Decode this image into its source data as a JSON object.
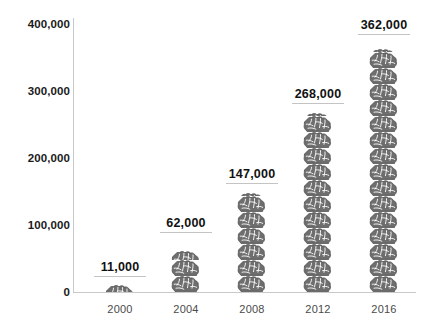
{
  "chart_data": {
    "type": "bar",
    "subtype": "pictograph",
    "title": "",
    "subtitle": "",
    "xlabel": "",
    "ylabel": "",
    "categories": [
      "2000",
      "2004",
      "2008",
      "2012",
      "2016"
    ],
    "values": [
      11000,
      62000,
      147000,
      268000,
      362000
    ],
    "value_labels": [
      "11,000",
      "62,000",
      "147,000",
      "268,000",
      "362,000"
    ],
    "ylim": [
      0,
      400000
    ],
    "ytick_values": [
      0,
      100000,
      200000,
      300000,
      400000
    ],
    "ytick_labels": [
      "0",
      "100,000",
      "200,000",
      "300,000",
      "400,000"
    ],
    "xtick_labels": [
      "2000",
      "2004",
      "2008",
      "2012",
      "2016"
    ],
    "grid": false,
    "legend": null,
    "icon": "brain-icon",
    "icon_unit_value": 24000,
    "series": [
      {
        "name": "",
        "values": [
          11000,
          62000,
          147000,
          268000,
          362000
        ]
      }
    ],
    "colors": {
      "icon": "#6e6e6e",
      "icon_outline": "#4d4d4d",
      "axis": "#c9c9c9",
      "value_label": "#111111",
      "ytick_label": "#1a1a1a",
      "xtick_label": "#4a4a4a",
      "underline": "#c4c4c4",
      "background": "#ffffff"
    }
  }
}
